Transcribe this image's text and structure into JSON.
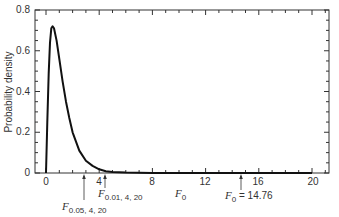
{
  "chart_data": {
    "type": "line",
    "title": "",
    "xlabel": "F0",
    "ylabel": "Probability density",
    "xlim": [
      -0.8,
      21.3
    ],
    "ylim": [
      0,
      0.8
    ],
    "grid": false,
    "legend": null,
    "x_ticks": [
      0,
      4,
      8,
      12,
      16,
      20
    ],
    "x_tick_labels": [
      "0",
      "4",
      "8",
      "12",
      "16",
      "20"
    ],
    "y_ticks": [
      0,
      0.2,
      0.4,
      0.6,
      0.8
    ],
    "y_tick_labels": [
      "0",
      "0.2",
      "0.4",
      "0.6",
      "0.8"
    ],
    "series": [
      {
        "name": "F distribution (4, 20) density",
        "x": [
          0,
          0.1,
          0.2,
          0.3,
          0.4,
          0.5,
          0.6,
          0.8,
          1.0,
          1.25,
          1.5,
          1.75,
          2.0,
          2.5,
          3.0,
          3.5,
          4.0,
          4.5,
          5.0,
          6,
          8,
          10,
          12,
          14,
          16,
          18,
          20
        ],
        "values": [
          0,
          0.25,
          0.49,
          0.64,
          0.71,
          0.72,
          0.71,
          0.65,
          0.56,
          0.45,
          0.35,
          0.27,
          0.2,
          0.11,
          0.06,
          0.035,
          0.018,
          0.009,
          0.005,
          0.002,
          0.0004,
          0.0001,
          0,
          0,
          0,
          0,
          0
        ]
      }
    ],
    "annotations": [
      {
        "text": "F",
        "subscript": "0.05, 4, 20",
        "x": 2.87,
        "arrow": true
      },
      {
        "text": "F",
        "subscript": "0.01, 4, 20",
        "x": 4.43,
        "arrow": true
      },
      {
        "text": "F",
        "subscript": "0",
        "x": 10.2,
        "arrow": false,
        "role": "axis-label"
      },
      {
        "text": "F",
        "subscript": "0",
        "suffix": " = 14.76",
        "x": 14.76,
        "arrow": true
      }
    ]
  },
  "labels": {
    "ylabel": "Probability density",
    "xlabel_main": "F",
    "xlabel_sub": "0",
    "ann1_main": "F",
    "ann1_sub": "0.05, 4, 20",
    "ann2_main": "F",
    "ann2_sub": "0.01, 4, 20",
    "ann3_main": "F",
    "ann3_sub": "0",
    "ann3_suffix": " = 14.76",
    "xt0": "0",
    "xt1": "4",
    "xt2": "8",
    "xt3": "12",
    "xt4": "16",
    "xt5": "20",
    "yt0": "0",
    "yt1": "0.2",
    "yt2": "0.4",
    "yt3": "0.6",
    "yt4": "0.8"
  }
}
